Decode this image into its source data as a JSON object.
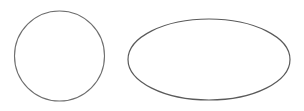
{
  "canvas": {
    "width": 304,
    "height": 111,
    "background": "#ffffff"
  },
  "shapes": [
    {
      "type": "circle",
      "cx": 59.5,
      "cy": 56,
      "r": 45,
      "stroke": "#6e6e6e",
      "stroke_width": 1.1,
      "fill": "none"
    },
    {
      "type": "ellipse",
      "cx": 209,
      "cy": 59.5,
      "rx": 81,
      "ry": 40.5,
      "stroke": "#5a5a5a",
      "stroke_width": 1.2,
      "fill": "none"
    }
  ]
}
